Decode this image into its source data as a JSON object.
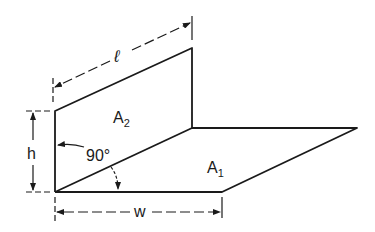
{
  "diagram": {
    "labels": {
      "length": "ℓ",
      "height": "h",
      "width": "w",
      "area_vertical": "A",
      "area_vertical_sub": "2",
      "area_horizontal": "A",
      "area_horizontal_sub": "1",
      "angle": "90°"
    },
    "colors": {
      "line": "#1a1a1a",
      "background": "#ffffff"
    }
  }
}
